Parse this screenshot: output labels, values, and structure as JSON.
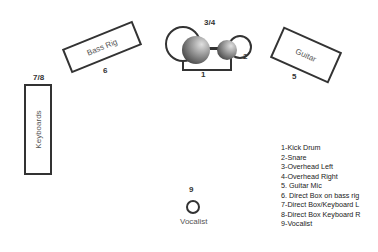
{
  "stage": {
    "bass_rig": {
      "label": "Bass Rig",
      "number": "6"
    },
    "keyboards": {
      "label": "Keyboards",
      "number": "7/8"
    },
    "guitar": {
      "label": "Guitar",
      "number": "5"
    },
    "drums": {
      "overhead_number": "3/4",
      "snare_number": "2",
      "kick_number": "1"
    },
    "vocalist": {
      "label": "Vocalist",
      "number": "9"
    }
  },
  "legend": {
    "items": [
      "1-Kick Drum",
      "2-Snare",
      "3-Overhead Left",
      "4-Overhead Right",
      "5. Guitar Mic",
      "6. Direct Box on bass rig",
      "7-Direct Box/Keyboard L",
      "8-Direct Box Keyboard R",
      "9-Vocalist"
    ]
  },
  "colors": {
    "stroke": "#333333",
    "drum_dark": "#444444",
    "drum_light": "#cccccc"
  }
}
